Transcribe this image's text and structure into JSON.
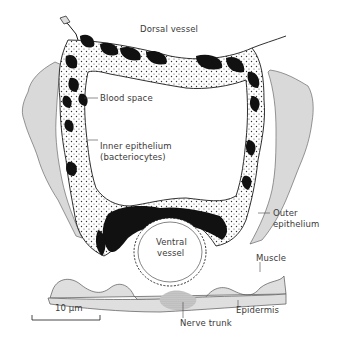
{
  "figure": {
    "type": "histological cross-section diagram",
    "labels": {
      "dorsal_vessel": "Dorsal vessel",
      "blood_space": "Blood space",
      "inner_epithelium_line1": "Inner epithelium",
      "inner_epithelium_line2": "(bacteriocytes)",
      "outer_epithelium_line1": "Outer",
      "outer_epithelium_line2": "epithelium",
      "ventral_vessel_line1": "Ventral",
      "ventral_vessel_line2": "vessel",
      "muscle": "Muscle",
      "epidermis": "Epidermis",
      "nerve_trunk": "Nerve trunk"
    },
    "scale_bar": {
      "label": "10 µm"
    },
    "colors": {
      "line": "#1a1a1a",
      "blood_space_fill": "#111111",
      "outer_epithelium_fill": "#d9d9d9",
      "inner_epithelium_stipple": "#333333",
      "background": "#ffffff"
    }
  }
}
